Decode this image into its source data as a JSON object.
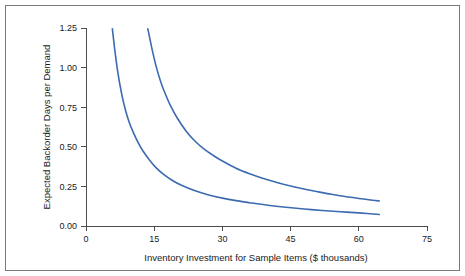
{
  "figure": {
    "background_color": "#ffffff",
    "frame_color": "#7a7a7a",
    "axis_color": "#4d4d4d"
  },
  "chart_data": {
    "type": "line",
    "title": "",
    "subtitle": "",
    "xlabel": "Inventory Investment for Sample Items ($ thousands)",
    "ylabel": "Expected Backorder Days per Demand",
    "xlim": [
      0,
      75
    ],
    "ylim": [
      0,
      1.25
    ],
    "grid": false,
    "legend": "none",
    "xticks": [
      0,
      15,
      30,
      45,
      60,
      75
    ],
    "xtick_labels": [
      "0",
      "15",
      "30",
      "45",
      "60",
      "75"
    ],
    "yticks": [
      0.0,
      0.25,
      0.5,
      0.75,
      1.0,
      1.25
    ],
    "ytick_labels": [
      "0.00",
      "0.25",
      "0.50",
      "0.75",
      "1.00",
      "1.25"
    ],
    "series": [
      {
        "name": "upper-curve",
        "color": "#3c6bb0",
        "x": [
          13.6,
          14.5,
          15.5,
          16.5,
          17.5,
          18.5,
          20,
          22,
          24,
          26,
          28,
          30,
          33,
          36,
          39,
          42,
          45,
          48,
          51,
          54,
          57,
          60,
          63,
          64.5
        ],
        "y": [
          1.245,
          1.12,
          1.0,
          0.905,
          0.83,
          0.765,
          0.685,
          0.6,
          0.535,
          0.485,
          0.445,
          0.41,
          0.365,
          0.33,
          0.3,
          0.275,
          0.253,
          0.233,
          0.216,
          0.2,
          0.186,
          0.174,
          0.163,
          0.158
        ]
      },
      {
        "name": "lower-curve",
        "color": "#3c6bb0",
        "x": [
          5.8,
          6.3,
          7,
          7.8,
          8.6,
          9.5,
          10.5,
          11.5,
          12.5,
          14,
          15.5,
          17,
          19,
          21,
          24,
          27,
          30,
          33,
          36,
          40,
          44,
          48,
          52,
          56,
          60,
          64.5
        ],
        "y": [
          1.245,
          1.12,
          0.97,
          0.84,
          0.74,
          0.655,
          0.585,
          0.525,
          0.475,
          0.415,
          0.365,
          0.327,
          0.287,
          0.257,
          0.222,
          0.196,
          0.176,
          0.16,
          0.147,
          0.131,
          0.118,
          0.107,
          0.098,
          0.09,
          0.083,
          0.073
        ]
      }
    ]
  },
  "geometry": {
    "plot_left": 86,
    "plot_right": 427,
    "plot_bottom": 226,
    "plot_top": 28
  }
}
